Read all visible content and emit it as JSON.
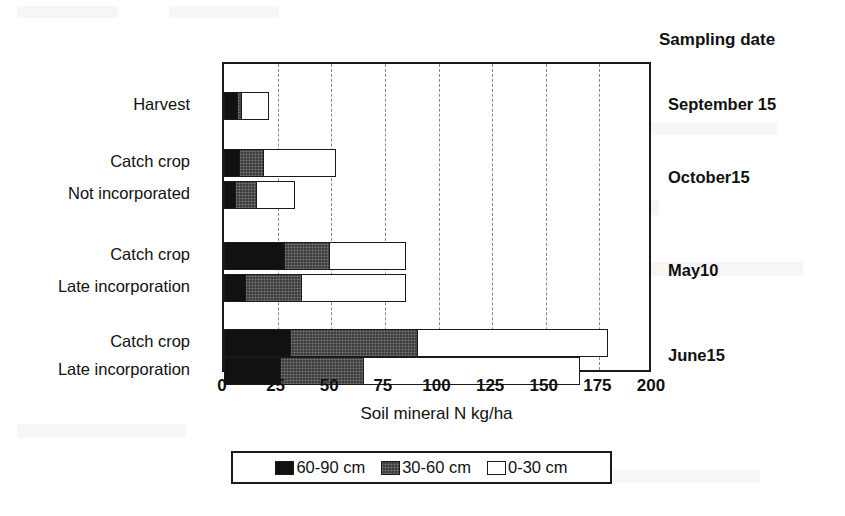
{
  "chart_data": {
    "type": "bar",
    "orientation": "horizontal",
    "stacked": true,
    "title": "",
    "xlabel": "Soil mineral N kg/ha",
    "ylabel": "",
    "xlim": [
      0,
      200
    ],
    "xticks": [
      0,
      25,
      50,
      75,
      100,
      125,
      150,
      175,
      200
    ],
    "xtick_labels": [
      "0",
      "25",
      "50",
      "75",
      "100",
      "125",
      "150",
      "175",
      "200"
    ],
    "grid": "vertical-dashed",
    "legend_position": "below-axis",
    "legend_entries": [
      "60-90 cm",
      "30-60 cm",
      "0-30 cm"
    ],
    "series": [
      {
        "name": "60-90 cm",
        "color": "#111111",
        "values": [
          6,
          7,
          5,
          28,
          10,
          31,
          26
        ]
      },
      {
        "name": "30-60 cm",
        "color": "#3d3d3d",
        "values": [
          2,
          11,
          10,
          21,
          26,
          59,
          39
        ]
      },
      {
        "name": "0-30 cm",
        "color": "#ffffff",
        "values": [
          13,
          34,
          18,
          36,
          49,
          89,
          101
        ]
      }
    ],
    "categories": [
      "Harvest",
      "Catch crop",
      "Not incorporated",
      "Catch crop",
      "Late incorporation",
      "Catch crop",
      "Late incorporation"
    ],
    "totals": [
      21,
      52,
      33,
      85,
      85,
      179,
      166
    ],
    "group_label": "Sampling date",
    "groups": [
      {
        "label": "September 15",
        "rows": [
          0
        ]
      },
      {
        "label": "October15",
        "rows": [
          1,
          2
        ]
      },
      {
        "label": "May10",
        "rows": [
          3,
          4
        ]
      },
      {
        "label": "June15",
        "rows": [
          5,
          6
        ]
      }
    ]
  },
  "axis": {
    "x_title": "Soil mineral N kg/ha",
    "tick_labels": [
      "0",
      "25",
      "50",
      "75",
      "100",
      "125",
      "150",
      "175",
      "200"
    ]
  },
  "categories": [
    {
      "label": "Harvest"
    },
    {
      "label": "Catch crop"
    },
    {
      "label": "Not incorporated"
    },
    {
      "label": "Catch crop"
    },
    {
      "label": "Late incorporation"
    },
    {
      "label": "Catch crop"
    },
    {
      "label": "Late incorporation"
    }
  ],
  "sampling": {
    "title": "Sampling date",
    "dates": [
      {
        "label": "September 15"
      },
      {
        "label": "October15"
      },
      {
        "label": "May10"
      },
      {
        "label": "June15"
      }
    ]
  },
  "legend": {
    "items": [
      {
        "label": "60-90 cm",
        "color": "#111111"
      },
      {
        "label": "30-60 cm",
        "color": "#3d3d3d"
      },
      {
        "label": "0-30 cm",
        "color": "#ffffff"
      }
    ]
  }
}
